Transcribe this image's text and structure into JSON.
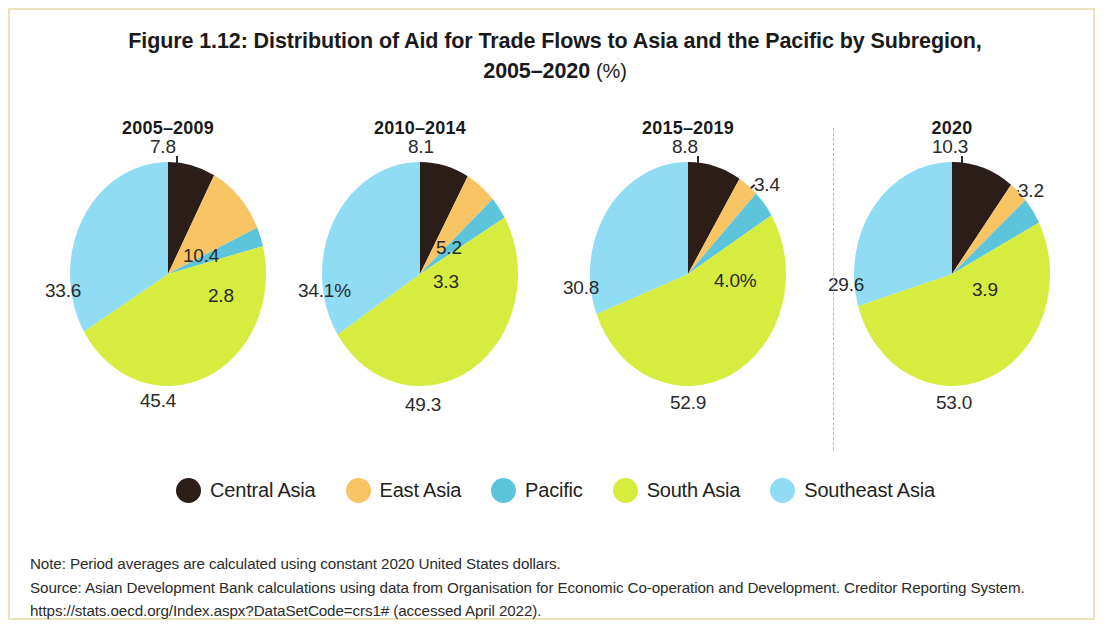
{
  "figure": {
    "title_line1": "Figure 1.12: Distribution of Aid for Trade Flows to Asia and the Pacific by Subregion,",
    "title_line2": "2005–2020",
    "title_unit": "(%)"
  },
  "legend": {
    "items": [
      {
        "label": "Central Asia",
        "color": "#2b1d18"
      },
      {
        "label": "East Asia",
        "color": "#f9c463"
      },
      {
        "label": "Pacific",
        "color": "#5cc4db"
      },
      {
        "label": "South Asia",
        "color": "#d6ec3f"
      },
      {
        "label": "Southeast Asia",
        "color": "#8fdcf4"
      }
    ]
  },
  "notes": {
    "note": "Note: Period averages are calculated using constant 2020 United States dollars.",
    "source": "Source: Asian Development Bank calculations using data from Organisation for Economic Co-operation and Development. Creditor Reporting System. https://stats.oecd.org/Index.aspx?DataSetCode=crs1# (accessed April 2022)."
  },
  "chart_data": {
    "type": "pie",
    "title": "Figure 1.12: Distribution of Aid for Trade Flows to Asia and the Pacific by Subregion, 2005–2020 (%)",
    "unit": "%",
    "legend_position": "bottom",
    "categories": [
      "Central Asia",
      "East Asia",
      "Pacific",
      "South Asia",
      "Southeast Asia"
    ],
    "colors": [
      "#2b1d18",
      "#f9c463",
      "#5cc4db",
      "#d6ec3f",
      "#8fdcf4"
    ],
    "charts": [
      {
        "title": "2005–2009",
        "values": [
          7.8,
          10.4,
          2.8,
          45.4,
          33.6
        ],
        "labels": [
          "7.8",
          "10.4",
          "2.8",
          "45.4",
          "33.6"
        ]
      },
      {
        "title": "2010–2014",
        "values": [
          8.1,
          5.2,
          3.3,
          49.3,
          34.1
        ],
        "labels": [
          "8.1",
          "5.2",
          "3.3",
          "49.3",
          "34.1%"
        ]
      },
      {
        "title": "2015–2019",
        "values": [
          8.8,
          3.4,
          4.0,
          52.9,
          30.8
        ],
        "labels": [
          "8.8",
          "3.4",
          "4.0%",
          "52.9",
          "30.8"
        ]
      },
      {
        "title": "2020",
        "values": [
          10.3,
          3.2,
          3.9,
          53.0,
          29.6
        ],
        "labels": [
          "10.3",
          "3.2",
          "3.9",
          "53.0",
          "29.6"
        ]
      }
    ]
  }
}
